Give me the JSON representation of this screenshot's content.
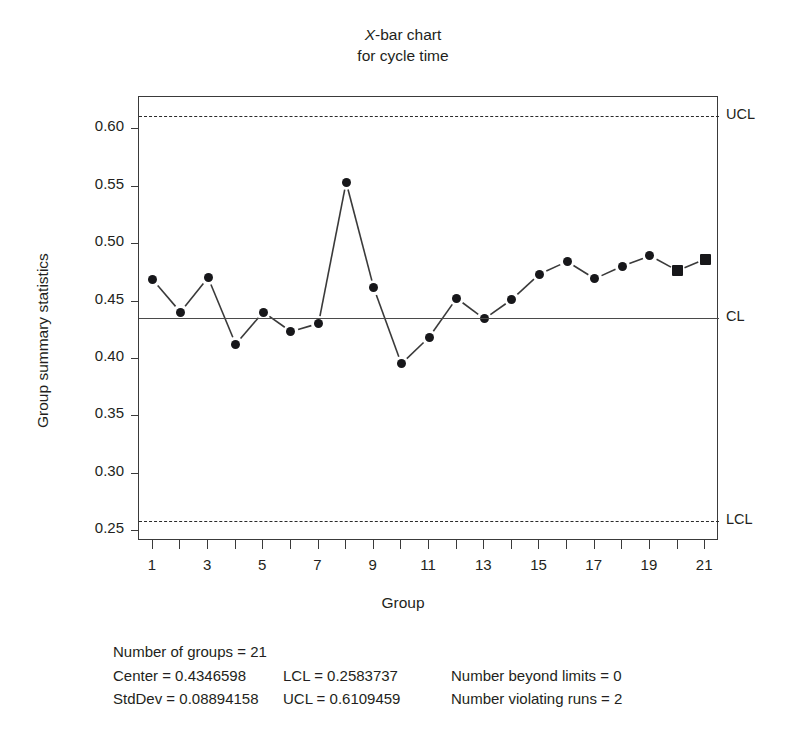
{
  "chart_data": {
    "type": "line",
    "title": "X-bar chart for cycle time",
    "title_line1_prefix": "X",
    "title_line1_suffix": "-bar chart",
    "title_line2": "for cycle time",
    "xlabel": "Group",
    "ylabel": "Group summary statistics",
    "grid": false,
    "legend_position": "none",
    "xlim": [
      0.5,
      21.5
    ],
    "ylim": [
      0.2407,
      0.6272
    ],
    "x": [
      1,
      2,
      3,
      4,
      5,
      6,
      7,
      8,
      9,
      10,
      11,
      12,
      13,
      14,
      15,
      16,
      17,
      18,
      19,
      20,
      21
    ],
    "xtick_labels": [
      "1",
      "",
      "3",
      "",
      "5",
      "",
      "7",
      "",
      "9",
      "",
      "11",
      "",
      "13",
      "",
      "15",
      "",
      "17",
      "",
      "19",
      "",
      "21"
    ],
    "ytick_labels": [
      "0.25",
      "0.30",
      "0.35",
      "0.40",
      "0.45",
      "0.50",
      "0.55",
      "0.60"
    ],
    "ytick_values": [
      0.25,
      0.3,
      0.35,
      0.4,
      0.45,
      0.5,
      0.55,
      0.6
    ],
    "series": [
      {
        "name": "Group summary statistics",
        "values": [
          0.468,
          0.44,
          0.47,
          0.412,
          0.44,
          0.423,
          0.43,
          0.553,
          0.461,
          0.395,
          0.418,
          0.452,
          0.434,
          0.451,
          0.473,
          0.484,
          0.469,
          0.48,
          0.489,
          0.476,
          0.486
        ],
        "marker_shapes": [
          "circle",
          "circle",
          "circle",
          "circle",
          "circle",
          "circle",
          "circle",
          "circle",
          "circle",
          "circle",
          "circle",
          "circle",
          "circle",
          "circle",
          "circle",
          "circle",
          "circle",
          "circle",
          "circle",
          "square",
          "square"
        ]
      }
    ],
    "control_lines": [
      {
        "key": "ucl",
        "label": "UCL",
        "value": 0.6109459,
        "style": "dashed"
      },
      {
        "key": "cl",
        "label": "CL",
        "value": 0.4346598,
        "style": "solid"
      },
      {
        "key": "lcl",
        "label": "LCL",
        "value": 0.2583737,
        "style": "dashed"
      }
    ]
  },
  "stats": {
    "number_of_groups": "Number of groups = 21",
    "center": "Center = 0.4346598",
    "stddev": "StdDev = 0.08894158",
    "lcl": "LCL = 0.2583737",
    "ucl": "UCL = 0.6109459",
    "beyond_limits": "Number beyond limits = 0",
    "violating_runs": "Number violating runs = 2"
  },
  "colors": {
    "marker": "#17171a",
    "line": "#3a3a3a",
    "text": "#231f20"
  }
}
